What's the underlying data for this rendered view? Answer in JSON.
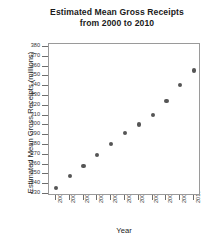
{
  "chart_data": {
    "type": "scatter",
    "title": "Estimated Mean Gross Receipts from 2000 to 2010",
    "title_lines": [
      "Estimated Mean Gross Receipts",
      "from 2000 to 2010"
    ],
    "xlabel": "Year",
    "ylabel": "Estimated Mean Gross Receipts (millions)",
    "x": [
      2000,
      2001,
      2002,
      2003,
      2004,
      2005,
      2006,
      2007,
      2008,
      2009,
      2010
    ],
    "categories": [
      "2000",
      "2001",
      "2002",
      "2003",
      "2004",
      "2005",
      "2006",
      "2007",
      "2008",
      "2009",
      "2010"
    ],
    "values": [
      236,
      248,
      259,
      270,
      281,
      292,
      301,
      311,
      325,
      341,
      356
    ],
    "series": [
      {
        "name": "Estimated Mean Gross Receipts",
        "values": [
          236,
          248,
          259,
          270,
          281,
          292,
          301,
          311,
          325,
          341,
          356
        ]
      }
    ],
    "xlim": [
      1999.5,
      2010.5
    ],
    "ylim": [
      228,
      383
    ],
    "ytick_values": [
      230,
      240,
      250,
      260,
      270,
      280,
      290,
      300,
      310,
      320,
      330,
      340,
      350,
      360,
      370,
      380
    ],
    "ytick_labels": [
      "230",
      "240",
      "250",
      "260",
      "270",
      "280",
      "290",
      "300",
      "310",
      "320",
      "330",
      "340",
      "350",
      "360",
      "370",
      "380"
    ],
    "xtick_labels": [
      "2000",
      "2001",
      "2002",
      "2003",
      "2004",
      "2005",
      "2006",
      "2007",
      "2008",
      "2009",
      "2010"
    ],
    "grid": false,
    "legend": false,
    "marker_color": "#555555",
    "frame_color": "#9a9a9a",
    "background_color": "#ffffff"
  }
}
